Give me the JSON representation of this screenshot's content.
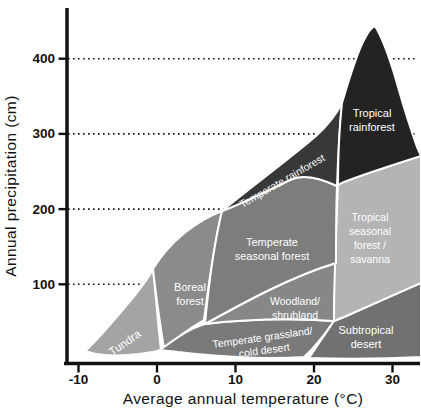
{
  "chart_data": {
    "type": "area",
    "xlabel": "Average annual temperature (°C)",
    "ylabel": "Annual precipitation (cm)",
    "xlim": [
      -13,
      33
    ],
    "ylim": [
      0,
      470
    ],
    "x_ticks": [
      -10,
      0,
      10,
      20,
      30
    ],
    "y_ticks": [
      100,
      200,
      300,
      400
    ],
    "grid": "horizontal-dotted",
    "grid_color": "#111111",
    "label_color": "#ffffff",
    "regions": [
      {
        "id": "tundra",
        "name": "Tundra",
        "label_lines": [
          "Tundra"
        ],
        "color": "#a4a4a4",
        "temp_range_c": [
          -9,
          0
        ],
        "precip_range_cm": [
          5,
          120
        ],
        "label_x": 127,
        "label_y": 346,
        "rotation": -35,
        "font_size": 11.5,
        "line_height": 13,
        "path": "M 86 350 C 98 340 116 318 136 294 C 143 285 149 277 153 269 C 156 296 158 325 161 350 C 143 355 112 357 96 354 C 89 352 86 352 86 350 Z"
      },
      {
        "id": "boreal-forest",
        "name": "Boreal forest",
        "label_lines": [
          "Boreal",
          "forest"
        ],
        "color": "#8b8b8b",
        "temp_range_c": [
          -1,
          9
        ],
        "precip_range_cm": [
          20,
          200
        ],
        "label_x": 190,
        "label_y": 291,
        "rotation": 0,
        "font_size": 11,
        "line_height": 14,
        "path": "M 153 269 C 170 241 196 221 222 211 C 216 236 209 281 204 320 C 190 328 175 339 164 349 C 160 323 156 296 153 269 Z"
      },
      {
        "id": "temperate-grassland-cold-desert",
        "name": "Temperate grassland/cold desert",
        "label_lines": [
          "Temperate grassland/",
          "cold desert"
        ],
        "color": "#7a7a7a",
        "temp_range_c": [
          0,
          22
        ],
        "precip_range_cm": [
          0,
          50
        ],
        "label_x": 263,
        "label_y": 341,
        "rotation": -8,
        "font_size": 10.5,
        "line_height": 13,
        "path": "M 160 350 C 175 339 190 328 205 324 C 240 320 290 318 334 321 C 325 334 315 347 304 357 C 265 360 215 356 178 352 C 171 351 165 351 160 350 Z"
      },
      {
        "id": "woodland-shrubland",
        "name": "Woodland/shrubland",
        "label_lines": [
          "Woodland/",
          "shrubland"
        ],
        "color": "#878787",
        "temp_range_c": [
          6,
          22.5
        ],
        "precip_range_cm": [
          45,
          130
        ],
        "label_x": 295,
        "label_y": 305,
        "rotation": 0,
        "font_size": 10.5,
        "line_height": 14,
        "path": "M 205 324 C 243 303 292 276 336 263 C 335 282 334 302 334 321 C 290 318 240 320 205 324 Z"
      },
      {
        "id": "subtropical-desert",
        "name": "Subtropical desert",
        "label_lines": [
          "Subtropical",
          "desert"
        ],
        "color": "#717171",
        "temp_range_c": [
          19,
          32
        ],
        "precip_range_cm": [
          0,
          100
        ],
        "label_x": 366,
        "label_y": 334,
        "rotation": 0,
        "font_size": 11,
        "line_height": 14,
        "path": "M 334 321 L 344 317 C 362 309 396 294 421 283 L 421 357 C 383 359 341 359 309 358 C 317 346 326 333 334 321 Z"
      },
      {
        "id": "tropical-seasonal-forest-savanna",
        "name": "Tropical seasonal forest/savanna",
        "label_lines": [
          "Tropical",
          "seasonal",
          "forest /",
          "savanna"
        ],
        "color": "#b4b4b4",
        "temp_range_c": [
          22.5,
          32
        ],
        "precip_range_cm": [
          50,
          270
        ],
        "label_x": 370,
        "label_y": 221,
        "rotation": 0,
        "font_size": 10.5,
        "line_height": 14,
        "path": "M 338 185 C 341 183 346 181 352 179 C 371 172 399 163 421 156 L 421 283 C 396 294 362 309 344 317 L 334 321 C 334 288 336 232 338 185 Z"
      },
      {
        "id": "temperate-seasonal-forest",
        "name": "Temperate seasonal forest",
        "label_lines": [
          "Temperate",
          "seasonal forest"
        ],
        "color": "#7d7d7d",
        "temp_range_c": [
          5,
          23
        ],
        "precip_range_cm": [
          50,
          235
        ],
        "label_x": 272,
        "label_y": 246,
        "rotation": 0,
        "font_size": 11,
        "line_height": 14,
        "path": "M 222 211 C 216 236 209 281 205 324 C 243 303 292 276 336 263 C 336 240 336 210 337 186 C 318 177 302 174 290 180 C 267 191 239 205 222 211 Z"
      },
      {
        "id": "temperate-rainforest",
        "name": "Temperate rainforest",
        "label_lines": [
          "Temperate rainforest"
        ],
        "color": "#383838",
        "temp_range_c": [
          8,
          23.5
        ],
        "precip_range_cm": [
          195,
          345
        ],
        "label_x": 284,
        "label_y": 184,
        "rotation": -30,
        "font_size": 10.5,
        "line_height": 13,
        "path": "M 222 211 C 252 186 287 161 316 136 C 327 126 336 115 342 103 C 339 131 338 159 337 186 C 318 177 302 174 290 180 C 267 191 239 205 222 211 Z"
      },
      {
        "id": "tropical-rainforest",
        "name": "Tropical rainforest",
        "label_lines": [
          "Tropical",
          "rainforest"
        ],
        "color": "#232323",
        "temp_range_c": [
          23,
          32
        ],
        "precip_range_cm": [
          230,
          445
        ],
        "label_x": 372,
        "label_y": 117,
        "rotation": 0,
        "font_size": 11,
        "line_height": 14,
        "path": "M 342 103 C 348 83 356 55 364 40 C 368 32 372 27 375 26 C 383 39 391 62 398 87 C 404 108 411 130 417 147 L 421 156 C 399 163 371 172 352 179 C 346 181 341 183 338 185 C 338 159 339 131 342 103 Z"
      }
    ]
  }
}
